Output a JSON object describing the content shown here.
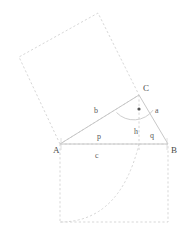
{
  "figure": {
    "kind": "geometry-diagram",
    "stroke_color": "#c8c8c8",
    "dashed_color": "#d0d0d0",
    "label_color": "#4a4a4a",
    "background": "#ffffff",
    "width": 188,
    "height": 230
  },
  "vertices": [
    {
      "name": "A",
      "label": "A",
      "x": 60,
      "y": 144,
      "label_x": 53,
      "label_y": 153
    },
    {
      "name": "B",
      "label": "B",
      "x": 168,
      "y": 144,
      "label_x": 171,
      "label_y": 153
    },
    {
      "name": "C",
      "label": "C",
      "x": 139,
      "y": 95,
      "label_x": 143,
      "label_y": 91
    }
  ],
  "foot_of_altitude": {
    "name": "H",
    "x": 139,
    "y": 144
  },
  "side_labels": [
    {
      "name": "a",
      "label": "a",
      "x": 155,
      "y": 113
    },
    {
      "name": "b",
      "label": "b",
      "x": 96,
      "y": 113
    },
    {
      "name": "c",
      "label": "c",
      "x": 97,
      "y": 157
    },
    {
      "name": "h",
      "label": "h",
      "x": 135,
      "y": 134
    },
    {
      "name": "p",
      "label": "p",
      "x": 98,
      "y": 138
    },
    {
      "name": "q",
      "label": "q",
      "x": 151,
      "y": 136
    }
  ],
  "triangle": {
    "edges": [
      {
        "name": "edge-AB",
        "from": "A",
        "to": "B"
      },
      {
        "name": "edge-AC",
        "from": "A",
        "to": "C"
      },
      {
        "name": "edge-CB",
        "from": "C",
        "to": "B"
      }
    ]
  },
  "altitude": {
    "name": "altitude-CH",
    "from": "C",
    "to": "H",
    "dashed": true
  },
  "right_angle_mark": {
    "name": "right-angle-dot",
    "dot_x": 139,
    "dot_y": 109,
    "dot_r": 1.6,
    "arc_path": "M 116.5 112.5 A 24 24 0 0 0 153.2 110.0"
  },
  "square_on_b": {
    "name": "square-on-leg-b",
    "points": "60,144 19,57 98,13 139,95",
    "dashed": true
  },
  "square_on_c": {
    "name": "square-on-side-c",
    "points": "60,144 60,222 168,222 168,144",
    "dashed": true
  },
  "arc_in_lower_square": {
    "name": "quarter-arc",
    "path": "M 60 222 Q 120 222 139 144",
    "dashed": true
  }
}
